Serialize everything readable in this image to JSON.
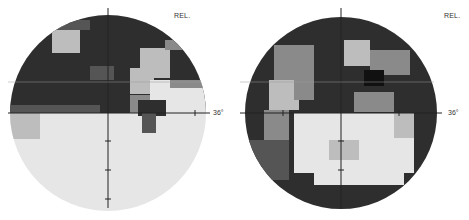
{
  "figure": {
    "type": "visual-field-grayscale-maps",
    "plots": [
      {
        "id": "left",
        "label": "REL.",
        "eccentricity_label": "36°"
      },
      {
        "id": "right",
        "label": "REL.",
        "eccentricity_label": "36°"
      }
    ],
    "colors": {
      "dark": "#2e2e2e",
      "mid_dark": "#555555",
      "mid": "#8a8a8a",
      "light": "#bdbdbd",
      "very_light": "#e6e6e6",
      "axis": "#222222"
    }
  }
}
